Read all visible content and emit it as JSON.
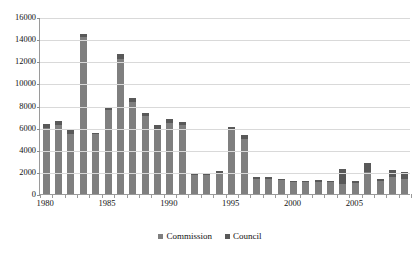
{
  "chart_data": {
    "type": "bar",
    "stacked": true,
    "title": "",
    "xlabel": "",
    "ylabel": "",
    "ylim": [
      0,
      16000
    ],
    "ytick_step": 2000,
    "yticks": [
      "0",
      "2000",
      "4000",
      "6000",
      "8000",
      "10000",
      "12000",
      "14000",
      "16000"
    ],
    "grid": true,
    "legend_position": "bottom",
    "categories": [
      "1980",
      "1981",
      "1982",
      "1983",
      "1984",
      "1985",
      "1986",
      "1987",
      "1988",
      "1989",
      "1990",
      "1991",
      "1992",
      "1993",
      "1994",
      "1995",
      "1996",
      "1997",
      "1998",
      "1999",
      "2000",
      "2001",
      "2002",
      "2003",
      "2004",
      "2005",
      "2006",
      "2007",
      "2008",
      "2009"
    ],
    "xtick_labels": [
      "1980",
      "1985",
      "1990",
      "1995",
      "2000",
      "2005"
    ],
    "xtick_label_categories": [
      "1980",
      "1985",
      "1990",
      "1995",
      "2000",
      "2005"
    ],
    "series": [
      {
        "name": "Commission",
        "color": "#7f7f7f",
        "values": [
          6000,
          6250,
          5400,
          14150,
          5400,
          7550,
          12200,
          8350,
          7050,
          5900,
          6450,
          6200,
          1700,
          1700,
          1850,
          5800,
          5000,
          1400,
          1350,
          1250,
          1050,
          1050,
          1100,
          1050,
          900,
          1000,
          1950,
          1150,
          1500,
          1400
        ]
      },
      {
        "name": "Council",
        "color": "#595959",
        "values": [
          300,
          350,
          350,
          350,
          150,
          350,
          450,
          300,
          250,
          300,
          300,
          350,
          200,
          200,
          200,
          300,
          300,
          150,
          150,
          150,
          100,
          100,
          150,
          150,
          1400,
          150,
          850,
          200,
          700,
          600
        ]
      }
    ],
    "totals": [
      6300,
      6600,
      5750,
      14500,
      5550,
      7900,
      12650,
      8650,
      7300,
      6200,
      6750,
      6550,
      1900,
      1900,
      2050,
      6100,
      5300,
      1550,
      1500,
      1400,
      1150,
      1150,
      1250,
      1200,
      2300,
      1150,
      2800,
      1350,
      2200,
      2000
    ]
  },
  "legend": {
    "items": [
      {
        "label": "Commission",
        "color": "#7f7f7f"
      },
      {
        "label": "Council",
        "color": "#595959"
      }
    ]
  }
}
